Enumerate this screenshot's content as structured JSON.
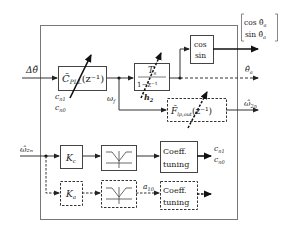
{
  "diagram": {
    "title": "",
    "inputs": {
      "delta_theta": "Δθ̃",
      "omega_2n": "ω̂₂ₙ"
    },
    "blocks": {
      "cpll": {
        "label": "C̃",
        "sub": "PLL",
        "arg": "(z⁻¹)"
      },
      "integrator": {
        "num": "T",
        "num_sub": "s",
        "den": "1−z⁻¹"
      },
      "trig": {
        "line1": "cos",
        "line2": "sin"
      },
      "flp": {
        "label": "F̃",
        "sub": "lp,out",
        "arg": "(z⁻¹)"
      },
      "kc": {
        "label": "K",
        "sub": "c"
      },
      "ka": {
        "label": "K",
        "sub": "a"
      },
      "coeff_top": {
        "line1": "Coeff.",
        "line2": "tuning"
      },
      "coeff_bottom": {
        "line1": "Coeff.",
        "line2": "tuning"
      }
    },
    "signals": {
      "cn1": "c",
      "cn1_sub": "n1",
      "cn0": "c",
      "cn0_sub": "n0",
      "omega_f": "ω",
      "omega_f_sub": "f",
      "h2": "h",
      "h2_sub": "2",
      "a10": "a",
      "a10_sub": "10",
      "out_cn1": "c",
      "out_cn1_sub": "n1",
      "out_cn0": "c",
      "out_cn0_sub": "n0",
      "theta_a": "θ̂",
      "theta_a_sub": "a",
      "omega_2n_out": "ω̂",
      "omega_2n_out_sub": "2n",
      "vec_cos": "cos θ̂",
      "vec_cos_sub": "a",
      "vec_sin": "sin θ̂",
      "vec_sin_sub": "a"
    },
    "colors": {
      "line": "#333333",
      "frame": "#666666",
      "dashed": "#333333"
    }
  }
}
